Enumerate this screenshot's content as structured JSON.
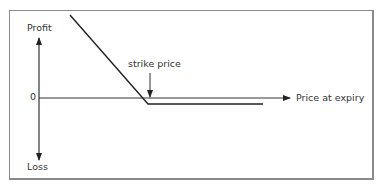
{
  "diagram": {
    "type": "payoff-diagram",
    "y_axis": {
      "top_label": "Profit",
      "bottom_label": "Loss",
      "zero_label": "0"
    },
    "x_axis": {
      "label": "Price at expiry"
    },
    "annotation": {
      "label": "strike price"
    },
    "colors": {
      "line": "#333333",
      "frame": "#8a8a8a",
      "background": "#ffffff"
    }
  }
}
